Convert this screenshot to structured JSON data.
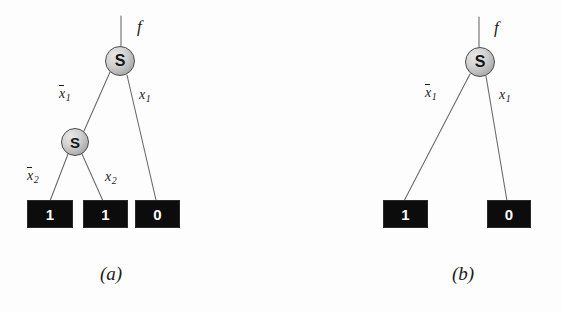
{
  "figure": {
    "background_color": "#fdfdfd",
    "node_fill_color": "#c6c6c6",
    "leaf_fill_color": "#0c0c0c",
    "leaf_text_color": "#fbfbfb",
    "edge_color": "#6b6b6b"
  },
  "diagrams": [
    {
      "id": "a",
      "caption": "(a)",
      "root_function_label": "f",
      "nodes": [
        {
          "id": "a-n1",
          "label": "S",
          "cx": 120,
          "cy": 61,
          "r": 15
        },
        {
          "id": "a-n2",
          "label": "S",
          "cx": 75,
          "cy": 142,
          "r": 14
        }
      ],
      "leaves": [
        {
          "id": "a-l1",
          "value": "1",
          "x": 27,
          "y": 200,
          "w": 46,
          "h": 28
        },
        {
          "id": "a-l2",
          "value": "1",
          "x": 83,
          "y": 200,
          "w": 45,
          "h": 28
        },
        {
          "id": "a-l3",
          "value": "0",
          "x": 135,
          "y": 200,
          "w": 45,
          "h": 28
        }
      ],
      "edge_labels": [
        {
          "id": "a-e1",
          "text": "x1",
          "overbar": true,
          "var": "x",
          "sub": "1",
          "x": 59,
          "y": 86
        },
        {
          "id": "a-e2",
          "text": "x1",
          "overbar": false,
          "var": "x",
          "sub": "1",
          "x": 138,
          "y": 86
        },
        {
          "id": "a-e3",
          "text": "x2",
          "overbar": true,
          "var": "x",
          "sub": "2",
          "x": 26,
          "y": 168
        },
        {
          "id": "a-e4",
          "text": "x2",
          "overbar": false,
          "var": "x",
          "sub": "2",
          "x": 104,
          "y": 168
        }
      ]
    },
    {
      "id": "b",
      "caption": "(b)",
      "root_function_label": "f",
      "nodes": [
        {
          "id": "b-n1",
          "label": "S",
          "cx": 480,
          "cy": 62,
          "r": 15
        }
      ],
      "leaves": [
        {
          "id": "b-l1",
          "value": "1",
          "x": 383,
          "y": 200,
          "w": 45,
          "h": 28
        },
        {
          "id": "b-l2",
          "value": "0",
          "x": 487,
          "y": 200,
          "w": 44,
          "h": 28
        }
      ],
      "edge_labels": [
        {
          "id": "b-e1",
          "text": "x1",
          "overbar": true,
          "var": "x",
          "sub": "1",
          "x": 424,
          "y": 85
        },
        {
          "id": "b-e2",
          "text": "x1",
          "overbar": false,
          "var": "x",
          "sub": "1",
          "x": 498,
          "y": 87
        }
      ]
    }
  ],
  "labels": {
    "f_a": "f",
    "f_b": "f",
    "caption_a": "(a)",
    "caption_b": "(b)",
    "node_a1": "S",
    "node_a2": "S",
    "node_b1": "S",
    "leaf_a1": "1",
    "leaf_a2": "1",
    "leaf_a3": "0",
    "leaf_b1": "1",
    "leaf_b2": "0",
    "var_x": "x",
    "sub_1": "1",
    "sub_2": "2"
  }
}
